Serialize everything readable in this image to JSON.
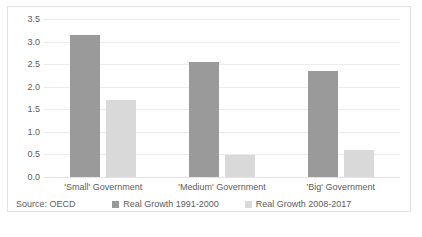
{
  "chart_data": {
    "type": "bar",
    "title": "",
    "xlabel": "",
    "ylabel": "",
    "categories": [
      "'Small' Government",
      "'Medium' Government",
      "'Big' Government"
    ],
    "series": [
      {
        "name": "Real Growth 1991-2000",
        "color": "#9a9a9a",
        "values": [
          3.15,
          2.55,
          2.35
        ]
      },
      {
        "name": "Real Growth 2008-2017",
        "color": "#d9d9d9",
        "values": [
          1.7,
          0.48,
          0.6
        ]
      }
    ],
    "ylim": [
      0.0,
      3.5
    ],
    "yticks": [
      "0.0",
      "0.5",
      "1.0",
      "1.5",
      "2.0",
      "2.5",
      "3.0",
      "3.5"
    ],
    "ytick_values": [
      0.0,
      0.5,
      1.0,
      1.5,
      2.0,
      2.5,
      3.0,
      3.5
    ],
    "grid": true,
    "grid_axis": "y",
    "legend_position": "bottom",
    "annotations": [
      "Source: OECD"
    ]
  },
  "footer": {
    "source": "Source: OECD"
  },
  "bottom_sliver": {
    "text": ""
  }
}
